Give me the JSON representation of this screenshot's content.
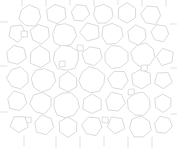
{
  "figure": {
    "title": "Two-dimensional foam cell tessellation",
    "type": "voronoi-foam-diagram",
    "width_px": 177,
    "height_px": 156,
    "background_color": "#ffffff",
    "wall_color": "#d6d6d6",
    "wall_width_px": 0.9,
    "cell_fill_color": "#ffffff"
  },
  "chart_data": {
    "type": "scatter",
    "title": "Two-dimensional foam cell tessellation",
    "xlabel": "",
    "ylabel": "",
    "xlim": [
      0,
      177
    ],
    "ylim": [
      0,
      156
    ],
    "grid": false,
    "legend": "none",
    "cells": [
      {
        "id": "c01",
        "cx": 30,
        "cy": 16,
        "r": 11,
        "sides": 7,
        "rot": 10
      },
      {
        "id": "c02",
        "cx": 56,
        "cy": 14,
        "r": 10,
        "sides": 6,
        "rot": 24
      },
      {
        "id": "c03",
        "cx": 80,
        "cy": 13,
        "r": 9,
        "sides": 6,
        "rot": 8
      },
      {
        "id": "c04",
        "cx": 103,
        "cy": 14,
        "r": 10,
        "sides": 7,
        "rot": 16
      },
      {
        "id": "c05",
        "cx": 127,
        "cy": 13,
        "r": 10,
        "sides": 6,
        "rot": 30
      },
      {
        "id": "c06",
        "cx": 151,
        "cy": 15,
        "r": 10,
        "sides": 6,
        "rot": 5
      },
      {
        "id": "c07",
        "cx": 17,
        "cy": 33,
        "r": 9,
        "sides": 5,
        "rot": 12
      },
      {
        "id": "c08",
        "cx": 40,
        "cy": 34,
        "r": 10,
        "sides": 6,
        "rot": 20
      },
      {
        "id": "c09",
        "cx": 64,
        "cy": 35,
        "r": 12,
        "sides": 8,
        "rot": 6
      },
      {
        "id": "c10",
        "cx": 90,
        "cy": 32,
        "r": 10,
        "sides": 5,
        "rot": 35
      },
      {
        "id": "c11",
        "cx": 112,
        "cy": 34,
        "r": 11,
        "sides": 7,
        "rot": 14
      },
      {
        "id": "c12",
        "cx": 137,
        "cy": 35,
        "r": 10,
        "sides": 6,
        "rot": 22
      },
      {
        "id": "c13",
        "cx": 160,
        "cy": 33,
        "r": 9,
        "sides": 6,
        "rot": 9
      },
      {
        "id": "c14",
        "cx": 24,
        "cy": 34,
        "r": 4,
        "sides": 4,
        "rot": 45
      },
      {
        "id": "c15",
        "cx": 16,
        "cy": 55,
        "r": 10,
        "sides": 6,
        "rot": 18
      },
      {
        "id": "c16",
        "cx": 40,
        "cy": 57,
        "r": 11,
        "sides": 6,
        "rot": 28
      },
      {
        "id": "c17",
        "cx": 66,
        "cy": 58,
        "r": 13,
        "sides": 9,
        "rot": 10
      },
      {
        "id": "c18",
        "cx": 92,
        "cy": 56,
        "r": 10,
        "sides": 6,
        "rot": 15
      },
      {
        "id": "c19",
        "cx": 116,
        "cy": 57,
        "r": 12,
        "sides": 8,
        "rot": 22
      },
      {
        "id": "c20",
        "cx": 143,
        "cy": 55,
        "r": 12,
        "sides": 8,
        "rot": 12
      },
      {
        "id": "c21",
        "cx": 165,
        "cy": 57,
        "r": 9,
        "sides": 5,
        "rot": 40
      },
      {
        "id": "c22",
        "cx": 18,
        "cy": 78,
        "r": 11,
        "sides": 7,
        "rot": 25
      },
      {
        "id": "c23",
        "cx": 43,
        "cy": 80,
        "r": 12,
        "sides": 8,
        "rot": 8
      },
      {
        "id": "c24",
        "cx": 68,
        "cy": 82,
        "r": 10,
        "sides": 6,
        "rot": 30
      },
      {
        "id": "c25",
        "cx": 92,
        "cy": 80,
        "r": 13,
        "sides": 9,
        "rot": 18
      },
      {
        "id": "c26",
        "cx": 118,
        "cy": 80,
        "r": 10,
        "sides": 6,
        "rot": 6
      },
      {
        "id": "c27",
        "cx": 141,
        "cy": 79,
        "r": 10,
        "sides": 6,
        "rot": 26
      },
      {
        "id": "c28",
        "cx": 163,
        "cy": 80,
        "r": 9,
        "sides": 5,
        "rot": 15
      },
      {
        "id": "c29",
        "cx": 62,
        "cy": 64,
        "r": 4,
        "sides": 4,
        "rot": 45
      },
      {
        "id": "c30",
        "cx": 144,
        "cy": 68,
        "r": 4,
        "sides": 4,
        "rot": 45
      },
      {
        "id": "c31",
        "cx": 17,
        "cy": 101,
        "r": 10,
        "sides": 6,
        "rot": 14
      },
      {
        "id": "c32",
        "cx": 41,
        "cy": 103,
        "r": 11,
        "sides": 7,
        "rot": 22
      },
      {
        "id": "c33",
        "cx": 66,
        "cy": 105,
        "r": 13,
        "sides": 9,
        "rot": 12
      },
      {
        "id": "c34",
        "cx": 92,
        "cy": 104,
        "r": 10,
        "sides": 6,
        "rot": 32
      },
      {
        "id": "c35",
        "cx": 115,
        "cy": 102,
        "r": 10,
        "sides": 6,
        "rot": 10
      },
      {
        "id": "c36",
        "cx": 139,
        "cy": 104,
        "r": 12,
        "sides": 8,
        "rot": 20
      },
      {
        "id": "c37",
        "cx": 163,
        "cy": 103,
        "r": 9,
        "sides": 6,
        "rot": 28
      },
      {
        "id": "c38",
        "cx": 28,
        "cy": 120,
        "r": 4,
        "sides": 4,
        "rot": 45
      },
      {
        "id": "c39",
        "cx": 19,
        "cy": 124,
        "r": 9,
        "sides": 5,
        "rot": 20
      },
      {
        "id": "c40",
        "cx": 44,
        "cy": 125,
        "r": 10,
        "sides": 6,
        "rot": 16
      },
      {
        "id": "c41",
        "cx": 68,
        "cy": 127,
        "r": 10,
        "sides": 6,
        "rot": 30
      },
      {
        "id": "c42",
        "cx": 92,
        "cy": 126,
        "r": 10,
        "sides": 6,
        "rot": 8
      },
      {
        "id": "c43",
        "cx": 116,
        "cy": 125,
        "r": 9,
        "sides": 5,
        "rot": 24
      },
      {
        "id": "c44",
        "cx": 140,
        "cy": 127,
        "r": 11,
        "sides": 7,
        "rot": 18
      },
      {
        "id": "c45",
        "cx": 163,
        "cy": 125,
        "r": 9,
        "sides": 6,
        "rot": 12
      },
      {
        "id": "c46",
        "cx": 105,
        "cy": 120,
        "r": 4,
        "sides": 4,
        "rot": 45
      },
      {
        "id": "c47",
        "cx": 80,
        "cy": 48,
        "r": 4,
        "sides": 4,
        "rot": 45
      },
      {
        "id": "c48",
        "cx": 131,
        "cy": 92,
        "r": 4,
        "sides": 4,
        "rot": 45
      }
    ],
    "edge_stubs": [
      {
        "x1": 22,
        "y1": 6,
        "x2": 22,
        "y2": 0
      },
      {
        "x1": 46,
        "y1": 6,
        "x2": 46,
        "y2": 0
      },
      {
        "x1": 70,
        "y1": 5,
        "x2": 70,
        "y2": 0
      },
      {
        "x1": 94,
        "y1": 6,
        "x2": 94,
        "y2": 0
      },
      {
        "x1": 118,
        "y1": 5,
        "x2": 118,
        "y2": 0
      },
      {
        "x1": 142,
        "y1": 6,
        "x2": 142,
        "y2": 0
      },
      {
        "x1": 166,
        "y1": 6,
        "x2": 166,
        "y2": 0
      },
      {
        "x1": 24,
        "y1": 136,
        "x2": 24,
        "y2": 146
      },
      {
        "x1": 56,
        "y1": 137,
        "x2": 56,
        "y2": 147
      },
      {
        "x1": 80,
        "y1": 137,
        "x2": 80,
        "y2": 147
      },
      {
        "x1": 104,
        "y1": 136,
        "x2": 104,
        "y2": 146
      },
      {
        "x1": 128,
        "y1": 137,
        "x2": 128,
        "y2": 147
      },
      {
        "x1": 152,
        "y1": 137,
        "x2": 152,
        "y2": 147
      },
      {
        "x1": 8,
        "y1": 22,
        "x2": 0,
        "y2": 22
      },
      {
        "x1": 7,
        "y1": 66,
        "x2": 0,
        "y2": 66
      },
      {
        "x1": 7,
        "y1": 112,
        "x2": 0,
        "y2": 112
      },
      {
        "x1": 170,
        "y1": 24,
        "x2": 177,
        "y2": 24
      },
      {
        "x1": 171,
        "y1": 68,
        "x2": 177,
        "y2": 68
      },
      {
        "x1": 171,
        "y1": 114,
        "x2": 177,
        "y2": 114
      }
    ]
  }
}
